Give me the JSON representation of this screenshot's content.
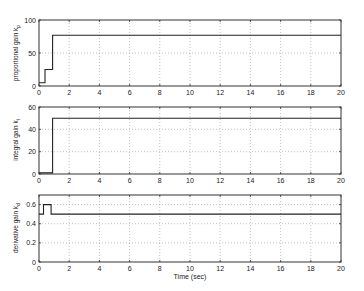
{
  "chart_data": [
    {
      "type": "line",
      "title": "",
      "xlabel": "",
      "ylabel": "proportional gain k_p",
      "xlim": [
        0,
        20
      ],
      "ylim": [
        0,
        100
      ],
      "xticks": [
        0,
        2,
        4,
        6,
        8,
        10,
        12,
        14,
        16,
        18,
        20
      ],
      "yticks": [
        0,
        50,
        100
      ],
      "grid": true,
      "series": [
        {
          "name": "k_p",
          "x": [
            0,
            0.4,
            0.4,
            0.9,
            0.9,
            20
          ],
          "values": [
            5,
            5,
            25,
            25,
            77,
            77
          ]
        }
      ]
    },
    {
      "type": "line",
      "title": "",
      "xlabel": "",
      "ylabel": "integral gain k_i",
      "xlim": [
        0,
        20
      ],
      "ylim": [
        0,
        60
      ],
      "xticks": [
        0,
        2,
        4,
        6,
        8,
        10,
        12,
        14,
        16,
        18,
        20
      ],
      "yticks": [
        0,
        20,
        40,
        60
      ],
      "grid": true,
      "series": [
        {
          "name": "k_i",
          "x": [
            0,
            0.9,
            0.9,
            20
          ],
          "values": [
            1,
            1,
            50,
            50
          ]
        }
      ]
    },
    {
      "type": "line",
      "title": "",
      "xlabel": "Time (sec)",
      "ylabel": "derivative gain k_d",
      "xlim": [
        0,
        20
      ],
      "ylim": [
        0,
        0.7
      ],
      "xticks": [
        0,
        2,
        4,
        6,
        8,
        10,
        12,
        14,
        16,
        18,
        20
      ],
      "yticks": [
        0,
        0.2,
        0.4,
        0.6
      ],
      "grid": true,
      "series": [
        {
          "name": "k_d",
          "x": [
            0,
            0.3,
            0.3,
            0.8,
            0.8,
            20
          ],
          "values": [
            0.5,
            0.5,
            0.6,
            0.6,
            0.5,
            0.5
          ]
        }
      ]
    }
  ],
  "labels": {
    "plot1_ylabel": "proportional gain k",
    "plot1_ysub": "p",
    "plot2_ylabel": "integral gain k",
    "plot2_ysub": "i",
    "plot3_ylabel": "derivative gain k",
    "plot3_ysub": "d",
    "xlabel": "Time (sec)"
  },
  "layout": {
    "x_left": 39,
    "x_right": 341,
    "panels": [
      {
        "top": 20,
        "bottom": 86,
        "yticklabels": [
          "0",
          "50",
          "100"
        ]
      },
      {
        "top": 107,
        "bottom": 174,
        "yticklabels": [
          "0",
          "20",
          "40",
          "60"
        ]
      },
      {
        "top": 195,
        "bottom": 262,
        "yticklabels": [
          "0",
          "0.2",
          "0.4",
          "0.6"
        ]
      }
    ],
    "xticklabels": [
      "0",
      "2",
      "4",
      "6",
      "8",
      "10",
      "12",
      "14",
      "16",
      "18",
      "20"
    ]
  }
}
